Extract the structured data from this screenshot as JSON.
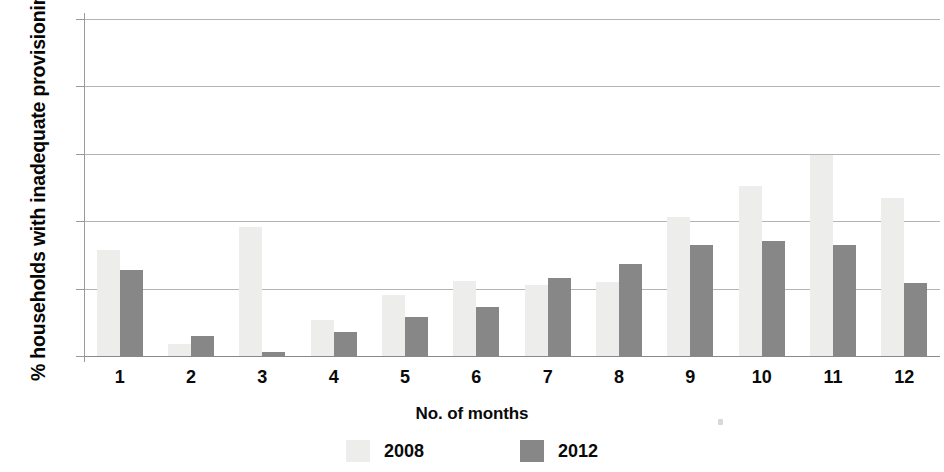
{
  "chart_data": {
    "type": "bar",
    "title": "",
    "xlabel": "No. of months",
    "ylabel": "% households with inadequate provisioning",
    "categories": [
      "1",
      "2",
      "3",
      "4",
      "5",
      "6",
      "7",
      "8",
      "9",
      "10",
      "11",
      "12"
    ],
    "series": [
      {
        "name": "2008",
        "color": "#ededeb",
        "values": [
          7.9,
          0.9,
          9.6,
          2.7,
          4.5,
          5.6,
          5.3,
          5.5,
          10.3,
          12.6,
          14.9,
          11.7
        ]
      },
      {
        "name": "2012",
        "color": "#878787",
        "values": [
          6.4,
          1.5,
          0.3,
          1.8,
          2.9,
          3.6,
          5.8,
          6.8,
          8.2,
          8.5,
          8.2,
          5.4
        ]
      }
    ],
    "ylim": [
      0,
      25
    ],
    "yticks": [
      0,
      5,
      10,
      15,
      20,
      25
    ],
    "ytick_labels": [
      "0",
      "5",
      "10",
      "15",
      "20",
      "25"
    ],
    "grid": true,
    "legend_position": "bottom",
    "legend_entries": [
      "2008",
      "2012"
    ]
  }
}
